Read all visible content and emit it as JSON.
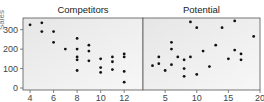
{
  "chart_data": {
    "type": "scatter",
    "ylabel": "Sales",
    "ylim": [
      0,
      360
    ],
    "yticks": [
      0,
      100,
      200,
      300
    ],
    "grid": false,
    "panels": [
      {
        "title": "Competitors",
        "xlim": [
          3.4,
          13.6
        ],
        "xticks": [
          4,
          6,
          8,
          10,
          12
        ],
        "points": [
          [
            4,
            325
          ],
          [
            5,
            335
          ],
          [
            5,
            290
          ],
          [
            6,
            290
          ],
          [
            6,
            235
          ],
          [
            7,
            200
          ],
          [
            8,
            255
          ],
          [
            8,
            200
          ],
          [
            8,
            160
          ],
          [
            8,
            145
          ],
          [
            8,
            90
          ],
          [
            9,
            220
          ],
          [
            9,
            190
          ],
          [
            9,
            140
          ],
          [
            10,
            150
          ],
          [
            10,
            105
          ],
          [
            10,
            80
          ],
          [
            11,
            160
          ],
          [
            11,
            135
          ],
          [
            11,
            95
          ],
          [
            12,
            175
          ],
          [
            12,
            160
          ],
          [
            12,
            85
          ],
          [
            12,
            30
          ]
        ]
      },
      {
        "title": "Potential",
        "xlim": [
          1.5,
          20
        ],
        "xticks": [
          5,
          10,
          15,
          20
        ],
        "points": [
          [
            3,
            115
          ],
          [
            4,
            125
          ],
          [
            4,
            160
          ],
          [
            5,
            90
          ],
          [
            6,
            120
          ],
          [
            6,
            235
          ],
          [
            6,
            200
          ],
          [
            7,
            160
          ],
          [
            8,
            145
          ],
          [
            8,
            100
          ],
          [
            8,
            60
          ],
          [
            9,
            340
          ],
          [
            9,
            160
          ],
          [
            10,
            310
          ],
          [
            10,
            70
          ],
          [
            11,
            190
          ],
          [
            12,
            110
          ],
          [
            13,
            220
          ],
          [
            14,
            310
          ],
          [
            15,
            150
          ],
          [
            16,
            345
          ],
          [
            16,
            195
          ],
          [
            17,
            175
          ],
          [
            17,
            145
          ],
          [
            19,
            265
          ]
        ]
      }
    ]
  }
}
